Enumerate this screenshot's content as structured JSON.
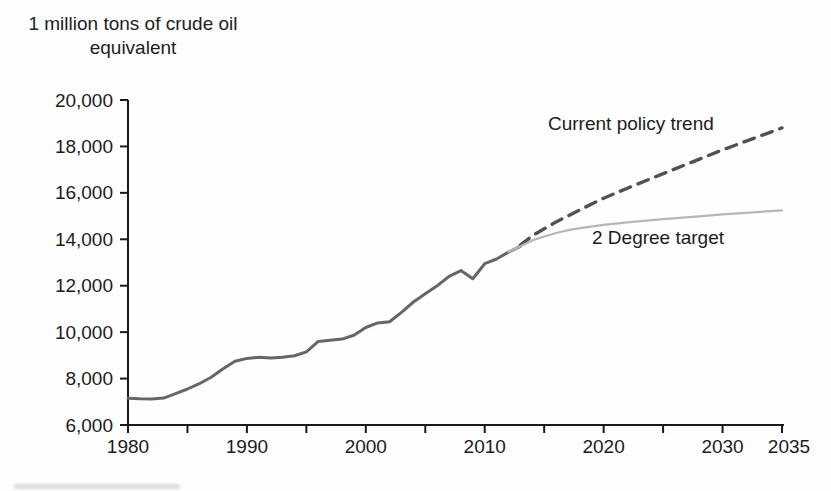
{
  "header": {
    "unit_label_line1": "1 million tons of crude oil",
    "unit_label_line2": "equivalent"
  },
  "annotations": {
    "current_policy_label": "Current policy trend",
    "two_degree_label": "2 Degree target"
  },
  "colors": {
    "axis": "#1a1a1a",
    "text": "#1c1c1c",
    "historical_line": "#666666",
    "current_policy_line": "#525252",
    "two_degree_line": "#b6b6b6"
  },
  "axes": {
    "y_ticks": [
      {
        "v": 6000,
        "label": "6,000"
      },
      {
        "v": 8000,
        "label": "8,000"
      },
      {
        "v": 10000,
        "label": "10,000"
      },
      {
        "v": 12000,
        "label": "12,000"
      },
      {
        "v": 14000,
        "label": "14,000"
      },
      {
        "v": 16000,
        "label": "16,000"
      },
      {
        "v": 18000,
        "label": "18,000"
      },
      {
        "v": 20000,
        "label": "20,000"
      }
    ],
    "x_ticks": [
      {
        "v": 1980,
        "label": "1980"
      },
      {
        "v": 1985
      },
      {
        "v": 1990,
        "label": "1990"
      },
      {
        "v": 1995
      },
      {
        "v": 2000,
        "label": "2000"
      },
      {
        "v": 2005
      },
      {
        "v": 2010,
        "label": "2010"
      },
      {
        "v": 2015
      },
      {
        "v": 2020,
        "label": "2020"
      },
      {
        "v": 2025
      },
      {
        "v": 2030,
        "label": "2030"
      },
      {
        "v": 2035,
        "label": "2035",
        "dx": 7
      }
    ]
  },
  "chart_data": {
    "type": "line",
    "title": "",
    "xlabel": "",
    "ylabel": "1 million tons of crude oil equivalent",
    "xlim": [
      1980,
      2035
    ],
    "ylim": [
      6000,
      20000
    ],
    "grid": false,
    "legend": "inline-annotations",
    "series": [
      {
        "id": "historical",
        "name": "Historical consumption",
        "style": "solid",
        "points": [
          [
            1980,
            7150
          ],
          [
            1981,
            7130
          ],
          [
            1982,
            7120
          ],
          [
            1983,
            7160
          ],
          [
            1984,
            7350
          ],
          [
            1985,
            7550
          ],
          [
            1986,
            7780
          ],
          [
            1987,
            8060
          ],
          [
            1988,
            8420
          ],
          [
            1989,
            8750
          ],
          [
            1990,
            8870
          ],
          [
            1991,
            8920
          ],
          [
            1992,
            8890
          ],
          [
            1993,
            8920
          ],
          [
            1994,
            8980
          ],
          [
            1995,
            9150
          ],
          [
            1996,
            9600
          ],
          [
            1997,
            9650
          ],
          [
            1998,
            9700
          ],
          [
            1999,
            9870
          ],
          [
            2000,
            10200
          ],
          [
            2001,
            10400
          ],
          [
            2002,
            10450
          ],
          [
            2003,
            10850
          ],
          [
            2004,
            11300
          ],
          [
            2005,
            11650
          ],
          [
            2006,
            12000
          ],
          [
            2007,
            12400
          ],
          [
            2008,
            12650
          ],
          [
            2009,
            12300
          ],
          [
            2010,
            12950
          ],
          [
            2011,
            13150
          ],
          [
            2012,
            13450
          ],
          [
            2013,
            13700
          ]
        ]
      },
      {
        "id": "current-policy-trend",
        "name": "Current policy trend",
        "style": "dashed",
        "points": [
          [
            2013,
            13750
          ],
          [
            2014,
            14150
          ],
          [
            2016,
            14750
          ],
          [
            2018,
            15270
          ],
          [
            2020,
            15770
          ],
          [
            2022,
            16200
          ],
          [
            2024,
            16620
          ],
          [
            2026,
            17030
          ],
          [
            2028,
            17440
          ],
          [
            2030,
            17850
          ],
          [
            2032,
            18230
          ],
          [
            2035,
            18800
          ]
        ]
      },
      {
        "id": "two-degree-target",
        "name": "2 Degree target",
        "style": "solid",
        "points": [
          [
            2012,
            13450
          ],
          [
            2013,
            13700
          ],
          [
            2014,
            13950
          ],
          [
            2015,
            14120
          ],
          [
            2016,
            14270
          ],
          [
            2017,
            14390
          ],
          [
            2018,
            14480
          ],
          [
            2020,
            14620
          ],
          [
            2022,
            14730
          ],
          [
            2025,
            14870
          ],
          [
            2028,
            14990
          ],
          [
            2030,
            15070
          ],
          [
            2032,
            15140
          ],
          [
            2035,
            15250
          ]
        ]
      }
    ]
  }
}
